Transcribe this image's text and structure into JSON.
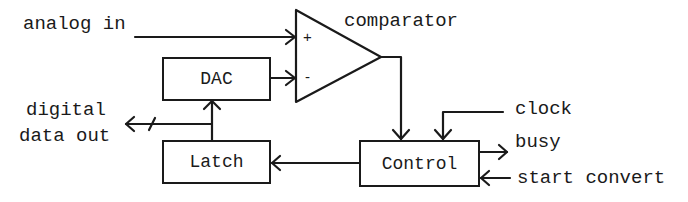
{
  "diagram": {
    "blocks": {
      "comparator": {
        "label": "comparator",
        "plus": "+",
        "minus": "-"
      },
      "dac": {
        "label": "DAC"
      },
      "latch": {
        "label": "Latch"
      },
      "control": {
        "label": "Control"
      }
    },
    "signals": {
      "analog_in": "analog in",
      "digital_out_line1": "digital",
      "digital_out_line2": "data out",
      "clock": "clock",
      "busy": "busy",
      "start_convert": "start convert"
    },
    "connections": [
      {
        "from": "analog in",
        "to": "comparator +"
      },
      {
        "from": "DAC",
        "to": "comparator -"
      },
      {
        "from": "comparator",
        "to": "Control"
      },
      {
        "from": "clock",
        "to": "Control"
      },
      {
        "from": "Control",
        "to": "busy"
      },
      {
        "from": "start convert",
        "to": "Control"
      },
      {
        "from": "Control",
        "to": "Latch"
      },
      {
        "from": "Latch",
        "to": "DAC"
      },
      {
        "from": "Latch",
        "to": "digital data out"
      }
    ],
    "colors": {
      "ink": "#1a1a1a",
      "background": "#ffffff"
    }
  }
}
